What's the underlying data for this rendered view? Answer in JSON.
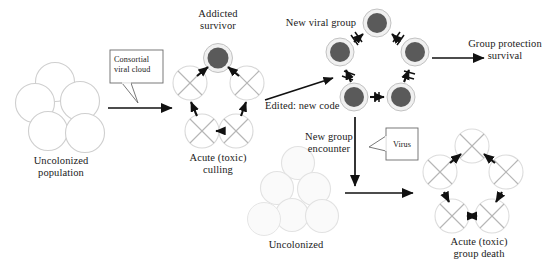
{
  "figure": {
    "width": 559,
    "height": 265,
    "background": "#ffffff",
    "colors": {
      "dark_cell_fill": "#5a5a5a",
      "dark_cell_ring": "#e8e8e8",
      "dark_cell_ring_stroke": "#bdbdbd",
      "empty_cell_stroke": "#cccccc",
      "faded_cell_stroke": "#dddddd",
      "faded_cell_fill": "#f5f5f5",
      "cross_stroke": "#b0b0b0",
      "arrow_black": "#111111",
      "text": "#1a1a1a",
      "callout_border": "#555555"
    }
  },
  "labels": {
    "uncolonized_population": "Uncolonized\npopulation",
    "consortial_viral_cloud": "Consortial\nviral cloud",
    "addicted_survivor": "Addicted\nsurvivor",
    "acute_toxic_culling": "Acute (toxic)\nculling",
    "new_viral_group": "New viral group",
    "edited_new_code": "Edited: new code",
    "group_protection_survival": "Group protection\nsurvival",
    "new_group_encounter": "New group\nencounter",
    "virus": "Virus",
    "uncolonized": "Uncolonized",
    "acute_toxic_group_death": "Acute (toxic)\ngroup death"
  },
  "panels": [
    {
      "id": "uncolonized-population",
      "label": "Uncolonized\npopulation",
      "cell_count": 5,
      "cell_style": "empty-outline"
    },
    {
      "id": "acute-toxic-culling",
      "label": "Acute (toxic)\nculling",
      "cell_count": 5,
      "cell_style": "crossed",
      "apex_cell_style": "dark-addicted",
      "apex_label": "Addicted\nsurvivor",
      "arrows": "blocked-inward"
    },
    {
      "id": "new-viral-group",
      "label": "New viral group",
      "cell_count": 5,
      "cell_style": "dark-addicted",
      "arrows": "blocked"
    },
    {
      "id": "uncolonized",
      "label": "Uncolonized",
      "cell_count": 6,
      "cell_style": "faded-outline"
    },
    {
      "id": "acute-toxic-group-death",
      "label": "Acute (toxic)\ngroup death",
      "cell_count": 5,
      "cell_style": "crossed",
      "arrows": "solid"
    }
  ],
  "connectors": [
    {
      "id": "colonization-arrow",
      "from": "uncolonized-population",
      "to": "acute-toxic-culling",
      "annotation": "Consortial\nviral cloud",
      "style": "solid-right"
    },
    {
      "id": "editing-arrow",
      "from": "acute-toxic-culling",
      "to": "new-viral-group",
      "annotation": "Edited: new code",
      "style": "solid-diagonal-up"
    },
    {
      "id": "survival-arrow",
      "from": "new-viral-group",
      "to": "group-protection-survival",
      "annotation": "Group protection\nsurvival",
      "style": "solid-right"
    },
    {
      "id": "encounter-arrow-down",
      "from": "new-viral-group",
      "to": "new-group-encounter",
      "annotation": "Virus",
      "style": "solid-down"
    },
    {
      "id": "encounter-arrow-right",
      "from": "uncolonized",
      "to": "acute-toxic-group-death",
      "annotation": "New group\nencounter",
      "style": "solid-right"
    }
  ]
}
